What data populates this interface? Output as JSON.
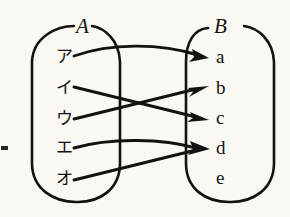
{
  "figure": {
    "type": "mapping-diagram",
    "background_color": "#faf8f3",
    "ink_color": "#141210",
    "sets": [
      {
        "id": "A",
        "label": "A",
        "side": "left",
        "shape": "stadium",
        "elements": [
          {
            "label": "ア",
            "romaji": "a"
          },
          {
            "label": "イ",
            "romaji": "i"
          },
          {
            "label": "ウ",
            "romaji": "u"
          },
          {
            "label": "エ",
            "romaji": "e"
          },
          {
            "label": "オ",
            "romaji": "o"
          }
        ]
      },
      {
        "id": "B",
        "label": "B",
        "side": "right",
        "shape": "stadium",
        "elements": [
          {
            "label": "a"
          },
          {
            "label": "b"
          },
          {
            "label": "c"
          },
          {
            "label": "d"
          },
          {
            "label": "e"
          }
        ]
      }
    ],
    "mappings": [
      {
        "from": "ア",
        "to": "a",
        "style": "curved"
      },
      {
        "from": "イ",
        "to": "c",
        "style": "straight"
      },
      {
        "from": "ウ",
        "to": "b",
        "style": "straight"
      },
      {
        "from": "エ",
        "to": "d",
        "style": "curved"
      },
      {
        "from": "オ",
        "to": "d",
        "style": "straight"
      }
    ],
    "unmapped_targets": [
      "e"
    ],
    "edge_artifact": {
      "present": true,
      "description": "cropped-mark"
    }
  }
}
